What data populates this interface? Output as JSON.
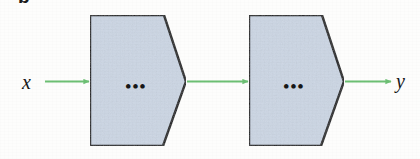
{
  "figure": {
    "panel_letter": "b",
    "input_label": "x",
    "output_label": "y",
    "block_placeholder": "•••",
    "colors": {
      "block_fill": "#ccd6e4",
      "block_stroke": "#17181a",
      "arrow": "#6cbf73",
      "text": "#161616",
      "background": "#fdfdfc"
    },
    "blocks": [
      {
        "name": "first-processing-block",
        "placeholder": "•••"
      },
      {
        "name": "second-processing-block",
        "placeholder": "•••"
      }
    ],
    "arrows": [
      {
        "name": "input-arrow",
        "from": "x",
        "to": "first-processing-block"
      },
      {
        "name": "interstage-arrow",
        "from": "first-processing-block",
        "to": "second-processing-block"
      },
      {
        "name": "output-arrow",
        "from": "second-processing-block",
        "to": "y"
      }
    ]
  }
}
